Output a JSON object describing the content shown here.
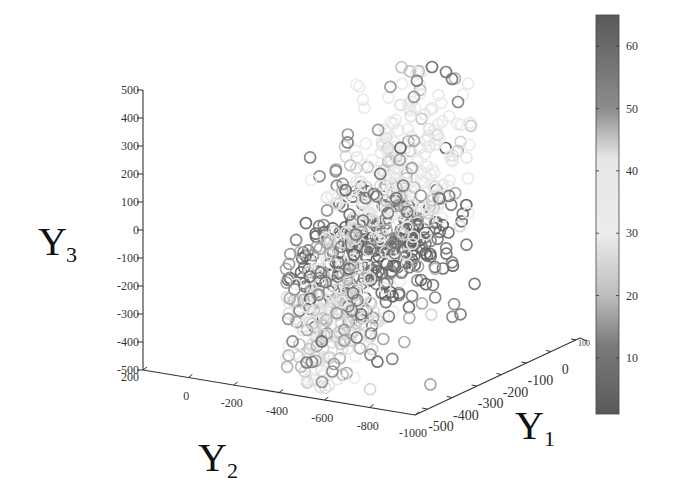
{
  "chart_data": {
    "type": "scatter",
    "subtype": "scatter3d",
    "title": "",
    "marker": "open-circle",
    "colormap": "grayscale (dark at low & high values, light in middle)",
    "axes": {
      "x": {
        "label": "Y",
        "label_sub": "1",
        "ticks": [
          "-500",
          "-400",
          "-300",
          "-200",
          "-100",
          "0",
          "100"
        ],
        "range": [
          -500,
          100
        ]
      },
      "y": {
        "label": "Y",
        "label_sub": "2",
        "ticks": [
          "200",
          "0",
          "-200",
          "-400",
          "-600",
          "-800",
          "-1000"
        ],
        "range": [
          200,
          -1000
        ]
      },
      "z": {
        "label": "Y",
        "label_sub": "3",
        "ticks": [
          "500",
          "400",
          "300",
          "200",
          "100",
          "0",
          "-100",
          "-200",
          "-300",
          "-400",
          "-500"
        ],
        "range": [
          -500,
          500
        ]
      }
    },
    "colorbar": {
      "ticks": [
        "60",
        "50",
        "40",
        "30",
        "20",
        "10"
      ],
      "range": [
        1,
        65
      ],
      "stops": [
        {
          "v": 65,
          "color": "#5a5a5a"
        },
        {
          "v": 50,
          "color": "#8c8c8c"
        },
        {
          "v": 42,
          "color": "#e6e6e6"
        },
        {
          "v": 30,
          "color": "#ececec"
        },
        {
          "v": 20,
          "color": "#bdbdbd"
        },
        {
          "v": 12,
          "color": "#7a7a7a"
        },
        {
          "v": 1,
          "color": "#5a5a5a"
        }
      ]
    },
    "clusters": [
      {
        "name": "dark-core",
        "center_px": [
          375,
          250
        ],
        "spread_px": [
          45,
          28
        ],
        "rotation_deg": -20,
        "count": 260,
        "value_mean": 60,
        "value_sd": 5,
        "color_hint": "#5e5e5e"
      },
      {
        "name": "light-upper",
        "center_px": [
          405,
          170
        ],
        "spread_px": [
          32,
          55
        ],
        "rotation_deg": 30,
        "count": 260,
        "value_mean": 38,
        "value_sd": 5,
        "color_hint": "#dcdcdc"
      },
      {
        "name": "light-lower",
        "center_px": [
          330,
          320
        ],
        "spread_px": [
          25,
          38
        ],
        "rotation_deg": 25,
        "count": 200,
        "value_mean": 25,
        "value_sd": 5,
        "color_hint": "#c8c8c8"
      },
      {
        "name": "mid-scatter",
        "center_px": [
          378,
          230
        ],
        "spread_px": [
          55,
          90
        ],
        "rotation_deg": 32,
        "count": 160,
        "value_mean": 15,
        "value_sd": 6,
        "color_hint": "#9a9a9a"
      }
    ],
    "outliers_px": [
      {
        "x": 432,
        "y": 67,
        "v": 62
      },
      {
        "x": 446,
        "y": 72,
        "v": 60
      },
      {
        "x": 452,
        "y": 79,
        "v": 58
      },
      {
        "x": 458,
        "y": 102,
        "v": 55
      },
      {
        "x": 461,
        "y": 125,
        "v": 40
      },
      {
        "x": 311,
        "y": 180,
        "v": 35
      },
      {
        "x": 322,
        "y": 382,
        "v": 14
      },
      {
        "x": 312,
        "y": 362,
        "v": 12
      },
      {
        "x": 334,
        "y": 364,
        "v": 15
      },
      {
        "x": 421,
        "y": 280,
        "v": 62
      },
      {
        "x": 299,
        "y": 325,
        "v": 30
      },
      {
        "x": 412,
        "y": 296,
        "v": 10
      }
    ],
    "legend": null,
    "grid": false
  },
  "labels": {
    "z_title": "Y",
    "z_sub": "3",
    "y_title": "Y",
    "y_sub": "2",
    "x_title": "Y",
    "x_sub": "1"
  }
}
